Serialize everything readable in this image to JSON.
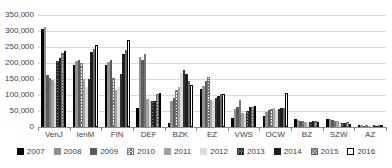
{
  "chart_data": {
    "type": "bar",
    "title": "",
    "xlabel": "",
    "ylabel": "",
    "ylim": [
      0,
      350000
    ],
    "ytick_interval": 50000,
    "ytick_labels": [
      "0",
      "50,000",
      "100,000",
      "150,000",
      "200,000",
      "250,000",
      "300,000",
      "350,000"
    ],
    "grid": true,
    "legend_position": "bottom",
    "categories": [
      "VenJ",
      "IenM",
      "FIN",
      "DEF",
      "BZK",
      "EZ",
      "VWS",
      "OCW",
      "BZ",
      "SZW",
      "AZ"
    ],
    "series": [
      {
        "name": "2007",
        "pattern": "solid-black",
        "values": [
          305000,
          195000,
          194000,
          58000,
          13000,
          120000,
          29000,
          34000,
          25000,
          26000,
          5000
        ]
      },
      {
        "name": "2008",
        "pattern": "solid-gray",
        "values": [
          312000,
          205000,
          204000,
          220000,
          80000,
          128000,
          55000,
          48000,
          22000,
          24000,
          5000
        ]
      },
      {
        "name": "2009",
        "pattern": "solid-darkgray",
        "values": [
          163000,
          210000,
          208000,
          210000,
          90000,
          145000,
          62000,
          52000,
          20000,
          22000,
          4000
        ]
      },
      {
        "name": "2010",
        "pattern": "crosshatch-light",
        "values": [
          152000,
          200000,
          153000,
          228000,
          115000,
          155000,
          85000,
          57000,
          18000,
          20000,
          4000
        ]
      },
      {
        "name": "2011",
        "pattern": "solid-gray",
        "values": [
          147000,
          150000,
          117000,
          88000,
          125000,
          85000,
          45000,
          60000,
          16000,
          18000,
          4000
        ]
      },
      {
        "name": "2012",
        "pattern": "solid-lightgray",
        "values": [
          143000,
          125000,
          125000,
          85000,
          168000,
          82000,
          42000,
          54000,
          12000,
          15000,
          3000
        ]
      },
      {
        "name": "2013",
        "pattern": "crosshatch-dark",
        "values": [
          205000,
          150000,
          165000,
          82000,
          178000,
          92000,
          50000,
          56000,
          15000,
          14000,
          3000
        ]
      },
      {
        "name": "2014",
        "pattern": "solid-nearblack",
        "values": [
          215000,
          235000,
          228000,
          80000,
          165000,
          98000,
          62000,
          58000,
          20000,
          13000,
          3000
        ]
      },
      {
        "name": "2015",
        "pattern": "hatch-gray",
        "values": [
          230000,
          245000,
          240000,
          102000,
          145000,
          102000,
          64000,
          60000,
          18000,
          15000,
          4000
        ]
      },
      {
        "name": "2016",
        "pattern": "white-outline",
        "values": [
          238000,
          255000,
          272000,
          105000,
          132000,
          104000,
          66000,
          107000,
          15000,
          10000,
          3000
        ]
      }
    ]
  },
  "colors": {
    "background": "#ffffff",
    "gridline": "#d9d9d9",
    "axis_line": "#8c8c8c",
    "axis_text": "#404040",
    "series_2007": "#000000",
    "series_2008": "#919191",
    "series_2009": "#5a5a5a",
    "series_2011": "#a3a3a3",
    "series_2012": "#dcdcdc",
    "series_2014": "#1f1f1f",
    "series_2016": "#ffffff"
  }
}
